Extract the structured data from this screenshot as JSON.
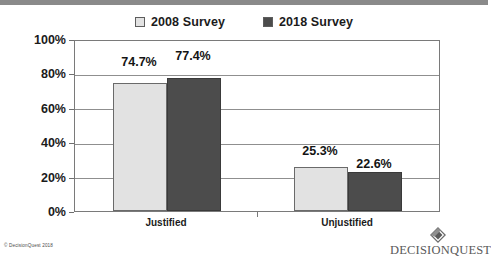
{
  "chart_data": {
    "type": "bar",
    "title": "",
    "subtitle": "",
    "xlabel": "",
    "ylabel": "",
    "categories": [
      "Justified",
      "Unjustified"
    ],
    "series": [
      {
        "name": "2008 Survey",
        "values": [
          74.7,
          22.6999999
        ],
        "value_labels": [
          "74.7%",
          "25.3%"
        ],
        "color": "#e2e2e2"
      },
      {
        "name": "2018 Survey",
        "values": [
          77.4,
          22.6
        ],
        "value_labels": [
          "77.4%",
          "22.6%"
        ],
        "color": "#4c4c4c"
      }
    ],
    "series_values": {
      "2008 Survey": {
        "Justified": 74.7,
        "Unjustified": 25.3
      },
      "2018 Survey": {
        "Justified": 77.4,
        "Unjustified": 22.6
      }
    },
    "ylim": [
      0,
      100
    ],
    "yticks": [
      0,
      20,
      40,
      60,
      80,
      100
    ],
    "ytick_labels": [
      "0%",
      "20%",
      "40%",
      "60%",
      "80%",
      "100%"
    ],
    "grid": true,
    "legend_position": "top-center"
  },
  "legend": {
    "entries": [
      {
        "label": "2008 Survey",
        "swatch": "light-square-swatch",
        "color": "#e2e2e2"
      },
      {
        "label": "2018 Survey",
        "swatch": "dark-square-swatch",
        "color": "#4c4c4c"
      }
    ]
  },
  "axis": {
    "ytick_labels": [
      "100%",
      "80%",
      "60%",
      "40%",
      "20%",
      "0%"
    ],
    "category_labels": [
      "Justified",
      "Unjustified"
    ]
  },
  "bars": [
    {
      "group": "Justified",
      "series": "2008 Survey",
      "value": 74.7,
      "label": "74.7%"
    },
    {
      "group": "Justified",
      "series": "2018 Survey",
      "value": 77.4,
      "label": "77.4%"
    },
    {
      "group": "Unjustified",
      "series": "2008 Survey",
      "value": 25.3,
      "label": "25.3%"
    },
    {
      "group": "Unjustified",
      "series": "2018 Survey",
      "value": 22.6,
      "label": "22.6%"
    }
  ],
  "footer": {
    "copyright": "© DecisionQuest 2018",
    "brand_name": "DECISIONQUEST"
  },
  "colors": {
    "series_2008": "#e2e2e2",
    "series_2018": "#4c4c4c",
    "grid": "#8f8f8f",
    "frame": "#7a7a7a",
    "top_band": "#8a8a8a",
    "text": "#1b1b1b"
  }
}
